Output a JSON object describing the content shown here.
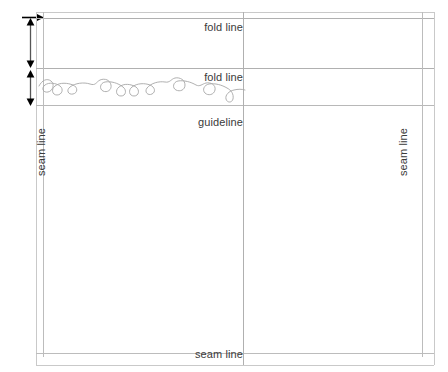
{
  "diagram": {
    "width": 448,
    "height": 372,
    "background_color": "#ffffff",
    "line_color": "#b8b8b8",
    "text_color": "#3a3a3a",
    "dimension_text_color": "#000000",
    "motif_color": "#a7a7a7"
  },
  "dimensions": [
    {
      "id": "top-allowance",
      "label": ".5\"",
      "marker": "right-arrow"
    },
    {
      "id": "cuff-depth",
      "label": "6\"",
      "marker": "double-arrow-vertical"
    },
    {
      "id": "band-depth",
      "label": "4.5\"",
      "marker": "double-arrow-vertical"
    }
  ],
  "labels": {
    "fold_line_top": "fold line",
    "fold_line_second": "fold line",
    "guideline": "guideline",
    "seam_line_left": "seam line",
    "seam_line_right": "seam line",
    "seam_line_bottom": "seam line"
  },
  "motif": {
    "name": "embroidered-vine-curl-motif",
    "description": "hand-drawn looping vine with curls"
  }
}
